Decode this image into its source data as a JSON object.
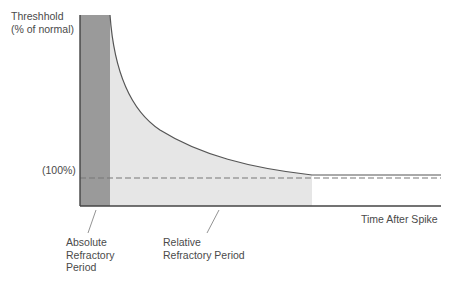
{
  "diagram": {
    "y_axis_label_line1": "Threshhold",
    "y_axis_label_line2": "(% of normal)",
    "baseline_label": "(100%)",
    "x_axis_label": "Time After Spike",
    "absolute_label_line1": "Absolute",
    "absolute_label_line2": "Refractory",
    "absolute_label_line3": "Period",
    "relative_label_line1": "Relative",
    "relative_label_line2": "Refractory Period",
    "colors": {
      "absolute_fill": "#9a9a9a",
      "relative_fill": "#e6e6e6",
      "curve": "#555555",
      "axis": "#444444",
      "dashed": "#777777"
    }
  }
}
